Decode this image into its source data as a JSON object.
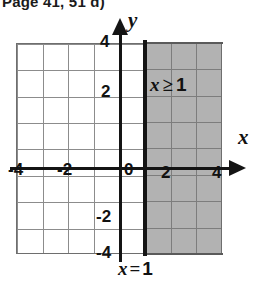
{
  "caption": "Page 41, 51 d)",
  "chart_data": {
    "type": "line",
    "title": "",
    "xlabel": "x",
    "ylabel": "y",
    "xlim": [
      -4,
      4
    ],
    "ylim": [
      -4,
      4
    ],
    "grid": true,
    "grid_step": 1,
    "x_ticks": [
      "-4",
      "-2",
      "0",
      "2",
      "4"
    ],
    "y_ticks": [
      "-4",
      "-2",
      "0",
      "2",
      "4"
    ],
    "x_tick_values": [
      -4,
      -2,
      0,
      2,
      4
    ],
    "y_tick_values": [
      -4,
      -2,
      0,
      2,
      4
    ],
    "origin_label": "0",
    "boundary_line": {
      "equation": "x = 1",
      "x_value": 1,
      "style": "solid",
      "orientation": "vertical"
    },
    "shaded_region": {
      "inequality": "x >= 1",
      "label": "x ≥ 1",
      "direction": "right",
      "from_x": 1,
      "to_x": 4,
      "from_y": -4,
      "to_y": 4,
      "fill_color": "#b2b2b2"
    },
    "legend": []
  },
  "labels": {
    "y_axis_name": "y",
    "x_axis_name": "x",
    "inequality": {
      "variable": "x",
      "relation": "≥",
      "value": "1"
    },
    "equation": {
      "variable": "x",
      "relation": "=",
      "value": "1"
    }
  },
  "ticks": {
    "y4": "4",
    "y2": "2",
    "y0": "0",
    "ym2": "-2",
    "ym4": "-4",
    "xm4": "-4",
    "xm2": "-2",
    "x2": "2",
    "x4": "4"
  },
  "colors": {
    "shade": "#b2b2b2",
    "grid_line": "#8c8c8c",
    "axis": "#141414",
    "text": "#111111",
    "background": "#ffffff"
  }
}
